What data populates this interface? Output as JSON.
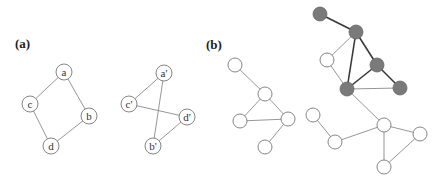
{
  "panels": {
    "a": {
      "label": "(a)",
      "graph1": {
        "nodes": [
          {
            "id": "a",
            "label": "a",
            "x": 64,
            "y": 72
          },
          {
            "id": "c",
            "label": "c",
            "x": 30,
            "y": 104
          },
          {
            "id": "b",
            "label": "b",
            "x": 89,
            "y": 116
          },
          {
            "id": "d",
            "label": "d",
            "x": 51,
            "y": 146
          }
        ],
        "edges": [
          [
            "a",
            "c"
          ],
          [
            "a",
            "b"
          ],
          [
            "c",
            "d"
          ],
          [
            "b",
            "d"
          ]
        ]
      },
      "graph2": {
        "nodes": [
          {
            "id": "a2",
            "label": "a'",
            "x": 164,
            "y": 73
          },
          {
            "id": "c2",
            "label": "c'",
            "x": 129,
            "y": 104
          },
          {
            "id": "d2",
            "label": "d'",
            "x": 187,
            "y": 117
          },
          {
            "id": "b2",
            "label": "b'",
            "x": 153,
            "y": 146
          }
        ],
        "edges": [
          [
            "a2",
            "c2"
          ],
          [
            "a2",
            "b2"
          ],
          [
            "c2",
            "d2"
          ],
          [
            "d2",
            "b2"
          ]
        ]
      }
    },
    "b": {
      "label": "(b)",
      "graph1": {
        "nodes": [
          {
            "id": "p1",
            "x": 235,
            "y": 65,
            "fill": "white"
          },
          {
            "id": "p2",
            "x": 265,
            "y": 94,
            "fill": "white"
          },
          {
            "id": "p3",
            "x": 240,
            "y": 121,
            "fill": "white"
          },
          {
            "id": "p4",
            "x": 288,
            "y": 119,
            "fill": "white"
          },
          {
            "id": "p5",
            "x": 265,
            "y": 147,
            "fill": "white"
          }
        ],
        "edges": [
          {
            "from": "p1",
            "to": "p2",
            "style": "light"
          },
          {
            "from": "p2",
            "to": "p3",
            "style": "light"
          },
          {
            "from": "p2",
            "to": "p4",
            "style": "light"
          },
          {
            "from": "p3",
            "to": "p4",
            "style": "light"
          },
          {
            "from": "p4",
            "to": "p5",
            "style": "light"
          }
        ]
      },
      "graph2": {
        "nodes": [
          {
            "id": "g1",
            "x": 320,
            "y": 14,
            "fill": "gray"
          },
          {
            "id": "g2",
            "x": 356,
            "y": 32,
            "fill": "gray"
          },
          {
            "id": "g3",
            "x": 377,
            "y": 65,
            "fill": "gray"
          },
          {
            "id": "g4",
            "x": 347,
            "y": 89,
            "fill": "gray"
          },
          {
            "id": "g5",
            "x": 400,
            "y": 88,
            "fill": "gray"
          },
          {
            "id": "w1",
            "x": 327,
            "y": 60,
            "fill": "white"
          },
          {
            "id": "w2",
            "x": 313,
            "y": 115,
            "fill": "white"
          },
          {
            "id": "w3",
            "x": 335,
            "y": 142,
            "fill": "white"
          },
          {
            "id": "w4",
            "x": 384,
            "y": 125,
            "fill": "white"
          },
          {
            "id": "w5",
            "x": 420,
            "y": 134,
            "fill": "white"
          },
          {
            "id": "w6",
            "x": 384,
            "y": 167,
            "fill": "white"
          }
        ],
        "edges": [
          {
            "from": "g1",
            "to": "g2",
            "style": "dark"
          },
          {
            "from": "g2",
            "to": "g3",
            "style": "dark"
          },
          {
            "from": "g2",
            "to": "g4",
            "style": "dark"
          },
          {
            "from": "g3",
            "to": "g4",
            "style": "dark"
          },
          {
            "from": "g3",
            "to": "g5",
            "style": "dark"
          },
          {
            "from": "g4",
            "to": "g5",
            "style": "light"
          },
          {
            "from": "g2",
            "to": "w1",
            "style": "light"
          },
          {
            "from": "w1",
            "to": "g4",
            "style": "light"
          },
          {
            "from": "g4",
            "to": "w4",
            "style": "light"
          },
          {
            "from": "w2",
            "to": "w3",
            "style": "light"
          },
          {
            "from": "w3",
            "to": "w4",
            "style": "light"
          },
          {
            "from": "w4",
            "to": "w5",
            "style": "light"
          },
          {
            "from": "w4",
            "to": "w6",
            "style": "light"
          },
          {
            "from": "w5",
            "to": "w6",
            "style": "light"
          }
        ]
      }
    }
  },
  "colors": {
    "node_gray": "#7a7a7a",
    "edge_dark": "#3a3a3a",
    "edge_light": "#8a8a8a",
    "node_stroke": "#777777"
  }
}
